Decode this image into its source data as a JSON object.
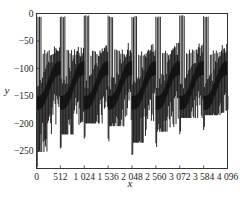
{
  "chart_data": {
    "type": "line",
    "title": "",
    "xlabel": "x",
    "ylabel": "y",
    "xlim": [
      0,
      4096
    ],
    "ylim": [
      -282,
      0
    ],
    "grid": false,
    "legend": null,
    "x_ticks": [
      0,
      512,
      1024,
      1536,
      2048,
      2560,
      3072,
      3584,
      4096
    ],
    "x_tick_labels": [
      "0",
      "512",
      "1 024",
      "1 536",
      "2 048",
      "2 560",
      "3 072",
      "3 584",
      "4 096"
    ],
    "y_ticks": [
      0,
      -50,
      -100,
      -150,
      -200,
      -250
    ],
    "y_tick_labels": [
      "0",
      "−50",
      "−100",
      "−150",
      "−200",
      "−250"
    ],
    "series": [
      {
        "name": "y",
        "color": "#111111",
        "description": "Dense periodic spiking signal, period about 512 samples; each period has ~4 tall spikes to about 0 followed by ~5 shorter spikes to about -65, a sawtooth center band between -90 and -160, and downward spikes to -200..-280",
        "period": 512,
        "num_periods": 8,
        "tall_spike_peak": -3,
        "short_spike_peak": -65,
        "center_band_high": -90,
        "center_band_low": -160,
        "min_per_period": [
          -282,
          -250,
          -230,
          -235,
          -265,
          -245,
          -220,
          -215
        ],
        "period_start_x": [
          0,
          512,
          1024,
          1536,
          2048,
          2560,
          3072,
          3584
        ]
      }
    ]
  },
  "labels": {
    "xlabel": "x",
    "ylabel": "y"
  }
}
